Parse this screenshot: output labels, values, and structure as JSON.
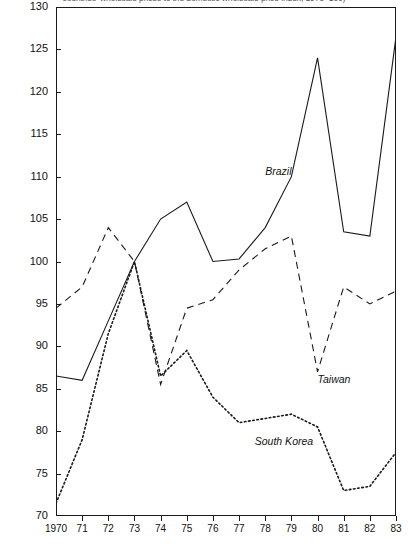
{
  "chart_data": {
    "type": "line",
    "title": "countries' wholesale prices to the domestic wholesale price index, 1973=100)",
    "xlabel": "",
    "ylabel": "",
    "x": [
      "1970",
      "71",
      "72",
      "73",
      "74",
      "75",
      "76",
      "77",
      "78",
      "79",
      "80",
      "81",
      "82",
      "83"
    ],
    "xlim": [
      1970,
      1983
    ],
    "ylim": [
      70,
      130
    ],
    "yticks": [
      "70",
      "75",
      "80",
      "85",
      "90",
      "95",
      "100",
      "105",
      "110",
      "115",
      "120",
      "125",
      "130"
    ],
    "grid": false,
    "legend_position": "inline-annotations",
    "series": [
      {
        "name": "Brazil",
        "style": "solid",
        "values": [
          86.5,
          86.0,
          93.0,
          100.0,
          105.0,
          107.0,
          100.0,
          100.3,
          104.0,
          110.0,
          124.0,
          103.5,
          103.0,
          126.5
        ]
      },
      {
        "name": "Taiwan",
        "style": "dashed",
        "values": [
          94.5,
          97.0,
          104.0,
          100.0,
          85.5,
          94.5,
          95.5,
          99.0,
          101.5,
          103.0,
          87.0,
          97.0,
          95.0,
          96.5
        ]
      },
      {
        "name": "South Korea",
        "style": "dotted",
        "values": [
          71.5,
          79.0,
          91.5,
          100.0,
          86.5,
          89.5,
          84.0,
          81.0,
          81.5,
          82.0,
          80.5,
          73.0,
          73.5,
          77.5
        ]
      }
    ],
    "annotations": [
      {
        "text": "Brazil",
        "x": 1978.0,
        "y": 110.5
      },
      {
        "text": "Taiwan",
        "x": 1980.0,
        "y": 86.0
      },
      {
        "text": "South Korea",
        "x": 1977.6,
        "y": 78.7
      }
    ],
    "colors": {
      "line": "#1a1a1a",
      "axis": "#1a1a1a",
      "background": "#ffffff"
    }
  }
}
